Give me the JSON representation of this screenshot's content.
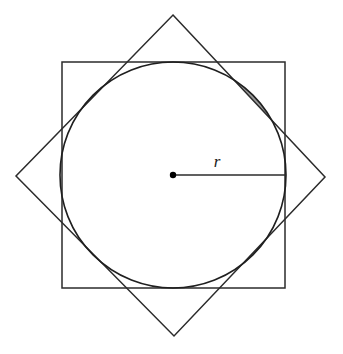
{
  "figure": {
    "canvas": {
      "width": 343,
      "height": 354,
      "background": "#ffffff"
    },
    "colors": {
      "stroke": "#2b2b2b",
      "circle_stroke": "#1f1f1f",
      "shade_fill": "#9a9a9a",
      "label_color": "#1a1a1a",
      "center_dot": "#000000",
      "background": "#ffffff"
    },
    "circle": {
      "name": "inscribed-circle",
      "cx": 173,
      "cy": 175,
      "r": 113,
      "stroke_width": 1.6
    },
    "square_axis": {
      "name": "axis-aligned-square",
      "x": 62,
      "y": 62,
      "width": 223,
      "height": 226,
      "stroke_width": 1.5
    },
    "square_rotated": {
      "name": "rotated-square-diamond",
      "points": "173,15 325,177 174,336 16,176",
      "stroke_width": 1.5
    },
    "center_dot": {
      "name": "circle-center-dot",
      "cx": 173,
      "cy": 175,
      "r": 3.2
    },
    "radius_line": {
      "name": "radius-segment",
      "x1": 173,
      "y1": 175,
      "x2": 285,
      "y2": 175,
      "stroke_width": 1.4
    },
    "radius_label": {
      "name": "radius-label",
      "text": "r",
      "x": 217,
      "y": 167
    }
  },
  "chart_data": {
    "type": "diagram",
    "annotations": [
      "r"
    ],
    "shapes": [
      {
        "kind": "circle",
        "label": "inscribed circle",
        "center": [
          173,
          175
        ],
        "radius": 113,
        "filled": false
      },
      {
        "kind": "square",
        "label": "axis-aligned circumscribed square",
        "corners": [
          [
            62,
            62
          ],
          [
            285,
            62
          ],
          [
            285,
            288
          ],
          [
            62,
            288
          ]
        ],
        "side": 226
      },
      {
        "kind": "square",
        "label": "rotated square (45 degrees)",
        "corners": [
          [
            173,
            15
          ],
          [
            325,
            177
          ],
          [
            174,
            336
          ],
          [
            16,
            176
          ]
        ],
        "side": 222
      },
      {
        "kind": "point",
        "label": "center",
        "position": [
          173,
          175
        ]
      },
      {
        "kind": "segment",
        "label": "r",
        "from": [
          173,
          175
        ],
        "to": [
          285,
          175
        ]
      }
    ],
    "shaded_regions": {
      "label": "circular segments outside the rotated square but inside the circle",
      "count": 8,
      "fill": "#9a9a9a"
    }
  }
}
